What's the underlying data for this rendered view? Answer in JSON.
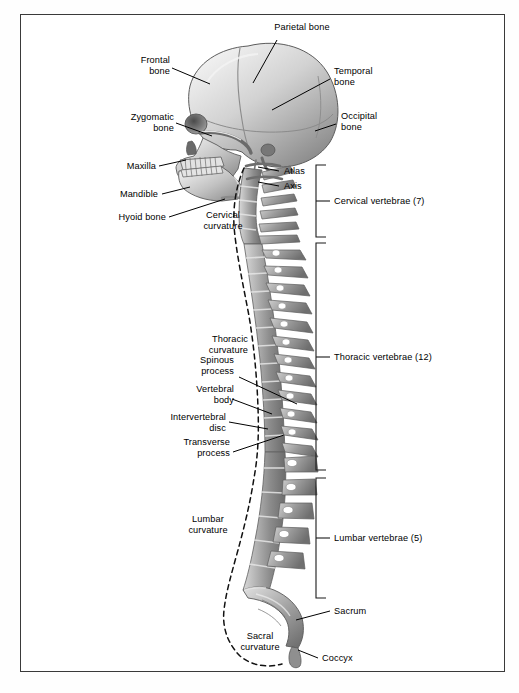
{
  "figure": {
    "border_color": "#3a3a3a",
    "background": "#ffffff",
    "bone_light": "#e9e9e9",
    "bone_mid": "#b8b8b8",
    "bone_dark": "#7d7d7d",
    "bone_shadow": "#5a5a5a",
    "leader_color": "#000000",
    "dashed_color": "#111111"
  },
  "labels": {
    "parietal_bone": "Parietal bone",
    "frontal_bone": "Frontal\nbone",
    "temporal_bone": "Temporal\nbone",
    "zygomatic_bone": "Zygomatic\nbone",
    "occipital_bone": "Occipital\nbone",
    "maxilla": "Maxilla",
    "mandible": "Mandible",
    "hyoid_bone": "Hyoid bone",
    "atlas": "Atlas",
    "axis": "Axis",
    "cervical_curvature": "Cervical\ncurvature",
    "thoracic_curvature": "Thoracic\ncurvature",
    "spinous_process": "Spinous\nprocess",
    "vertebral_body": "Vertebral\nbody",
    "intervertebral_disc": "Intervertebral\ndisc",
    "transverse_process": "Transverse\nprocess",
    "lumbar_curvature": "Lumbar\ncurvature",
    "sacral_curvature": "Sacral\ncurvature",
    "sacrum": "Sacrum",
    "coccyx": "Coccyx"
  },
  "brackets": [
    {
      "id": "cervical",
      "label": "Cervical vertebrae (7)",
      "count": 7,
      "top": 165,
      "bottom": 237
    },
    {
      "id": "thoracic",
      "label": "Thoracic vertebrae (12)",
      "count": 12,
      "top": 243,
      "bottom": 470
    },
    {
      "id": "lumbar",
      "label": "Lumbar vertebrae (5)",
      "count": 5,
      "top": 478,
      "bottom": 598
    }
  ]
}
